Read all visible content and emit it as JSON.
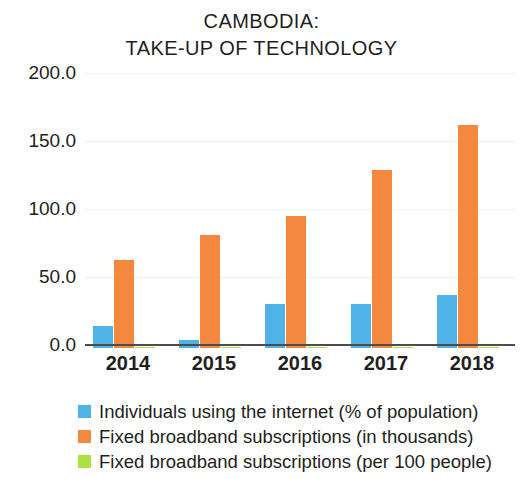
{
  "title": {
    "line1": "CAMBODIA:",
    "line2": "TAKE-UP OF TECHNOLOGY"
  },
  "axis": {
    "y_ticks": [
      "200.0",
      "150.0",
      "100.0",
      "50.0",
      "0.0"
    ],
    "x_ticks": [
      "2014",
      "2015",
      "2016",
      "2017",
      "2018"
    ]
  },
  "legend": {
    "items": [
      {
        "label": "Individuals using the internet (% of population)",
        "color": "#4fb3e8"
      },
      {
        "label": "Fixed broadband subscriptions (in thousands)",
        "color": "#f4883e"
      },
      {
        "label": "Fixed broadband subscriptions (per 100 people)",
        "color": "#abe23f"
      }
    ]
  },
  "chart_data": {
    "type": "bar",
    "title": "CAMBODIA: TAKE-UP OF TECHNOLOGY",
    "xlabel": "",
    "ylabel": "",
    "categories": [
      "2014",
      "2015",
      "2016",
      "2017",
      "2018"
    ],
    "ylim": [
      0,
      200
    ],
    "yticks": [
      0,
      50,
      100,
      150,
      200
    ],
    "grid": true,
    "legend_position": "bottom-left",
    "series": [
      {
        "name": "Individuals using the internet (% of population)",
        "color": "#4fb3e8",
        "values": [
          16.0,
          6.0,
          32.0,
          32.0,
          39.0
        ]
      },
      {
        "name": "Fixed broadband subscriptions (in thousands)",
        "color": "#f4883e",
        "values": [
          65.0,
          83.0,
          97.0,
          131.0,
          164.0
        ]
      },
      {
        "name": "Fixed broadband subscriptions (per 100 people)",
        "color": "#abe23f",
        "values": [
          0.4,
          0.5,
          0.6,
          0.8,
          1.0
        ]
      }
    ]
  }
}
